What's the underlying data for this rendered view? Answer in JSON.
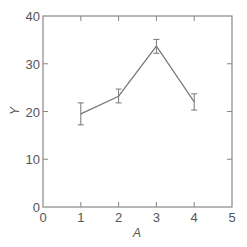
{
  "chart_data": {
    "type": "line",
    "title": "",
    "xlabel": "A",
    "ylabel": "Y",
    "xlim": [
      0,
      5
    ],
    "ylim": [
      0,
      40
    ],
    "xticks": [
      0,
      1,
      2,
      3,
      4,
      5
    ],
    "yticks": [
      0,
      10,
      20,
      30,
      40
    ],
    "grid": false,
    "legend": null,
    "tick_direction": "in",
    "error_bars": true,
    "series": [
      {
        "name": "Y",
        "x": [
          1,
          2,
          3,
          4
        ],
        "y": [
          19.5,
          23.2,
          33.7,
          22.0
        ],
        "y_err_low": [
          17.2,
          21.8,
          32.2,
          20.3
        ],
        "y_err_high": [
          21.8,
          24.7,
          35.1,
          23.7
        ]
      }
    ]
  },
  "style": {
    "axis_color": "#888888",
    "line_color": "#777777",
    "text_color": "#555555"
  },
  "labels": {
    "xlabel": "A",
    "ylabel": "Y"
  }
}
